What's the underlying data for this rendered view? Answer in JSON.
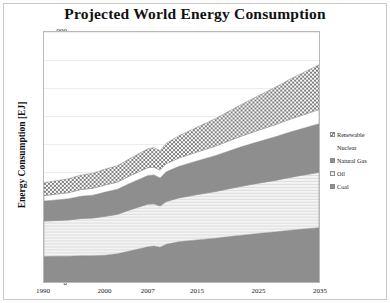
{
  "chart_data": {
    "type": "area",
    "title": "Projected World Energy Consumption",
    "xlabel": "",
    "ylabel": "Energy Consumption [EJ]",
    "stacked": true,
    "grid": true,
    "legend_position": "right",
    "xlim": [
      1990,
      2035
    ],
    "ylim": [
      0,
      900
    ],
    "ytick_labels": [
      "900",
      "800",
      "700",
      "600",
      "500",
      "400",
      "300",
      "200",
      "100",
      "0"
    ],
    "ytick_values": [
      900,
      800,
      700,
      600,
      500,
      400,
      300,
      200,
      100,
      0
    ],
    "xtick_labels": [
      "1990",
      "2000",
      "2007",
      "2015",
      "2025",
      "2035"
    ],
    "xtick_values": [
      1990,
      2000,
      2007,
      2015,
      2025,
      2035
    ],
    "x": [
      1990,
      1992,
      1994,
      1996,
      1998,
      2000,
      2002,
      2004,
      2006,
      2007,
      2008,
      2009,
      2010,
      2012,
      2015,
      2018,
      2020,
      2022,
      2025,
      2028,
      2030,
      2032,
      2035
    ],
    "series": [
      {
        "name": "Coal",
        "fill": "#8e8e8e",
        "pattern": "solid",
        "values": [
          92,
          93,
          93,
          95,
          95,
          97,
          102,
          112,
          122,
          127,
          130,
          126,
          136,
          145,
          152,
          158,
          163,
          168,
          175,
          181,
          186,
          190,
          196
        ]
      },
      {
        "name": "Oil",
        "fill": "#f2f2f2",
        "pattern": "fine-horizontal-lines",
        "values": [
          128,
          129,
          131,
          134,
          136,
          140,
          142,
          148,
          152,
          154,
          152,
          148,
          154,
          158,
          163,
          168,
          172,
          176,
          181,
          186,
          190,
          194,
          199
        ]
      },
      {
        "name": "Natural Gas",
        "fill": "#8e8e8e",
        "pattern": "solid",
        "values": [
          72,
          74,
          76,
          80,
          82,
          87,
          90,
          95,
          100,
          103,
          104,
          101,
          107,
          113,
          121,
          129,
          135,
          141,
          149,
          157,
          162,
          167,
          175
        ]
      },
      {
        "name": "Nuclear",
        "fill": "#ffffff",
        "pattern": "solid",
        "values": [
          19,
          21,
          22,
          24,
          25,
          26,
          26,
          27,
          28,
          28,
          28,
          28,
          29,
          30,
          32,
          34,
          36,
          38,
          41,
          44,
          46,
          48,
          51
        ]
      },
      {
        "name": "Renewable",
        "fill": "#9a9a9a",
        "pattern": "checkered",
        "values": [
          47,
          48,
          50,
          52,
          54,
          57,
          59,
          62,
          66,
          68,
          70,
          70,
          74,
          80,
          89,
          99,
          106,
          113,
          124,
          135,
          143,
          150,
          161
        ]
      }
    ],
    "totals": [
      358,
      365,
      372,
      385,
      392,
      407,
      419,
      444,
      468,
      480,
      484,
      473,
      500,
      526,
      557,
      588,
      612,
      636,
      670,
      703,
      727,
      749,
      782
    ],
    "annotations": [
      {
        "label": "2009 dip",
        "x": 2009,
        "note": "visible contraction in total consumption"
      }
    ]
  },
  "legend": {
    "items": [
      {
        "label": "Renewable"
      },
      {
        "label": "Nuclear"
      },
      {
        "label": "Natural Gas"
      },
      {
        "label": "Oil"
      },
      {
        "label": "Coal"
      }
    ]
  }
}
